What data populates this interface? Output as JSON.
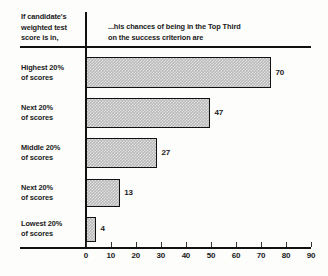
{
  "header": {
    "left_line1": "If candidate's",
    "left_line2": "weighted test",
    "left_line3": "score is in,",
    "right_line1": "...his chances of being in the Top Third",
    "right_line2": "on the success criterion are"
  },
  "colors": {
    "ink": "#111111",
    "bar_fill": "#b9b9b9",
    "background": "#fdfdfc"
  },
  "chart_data": {
    "type": "bar",
    "orientation": "horizontal",
    "title": "If candidate's weighted test score is in, ...his chances of being in the Top Third on the success criterion are",
    "xlabel": "",
    "ylabel": "",
    "xlim": [
      0,
      90
    ],
    "xticks": [
      0,
      10,
      20,
      30,
      40,
      50,
      60,
      70,
      80,
      90
    ],
    "grid": false,
    "legend": false,
    "categories": [
      "Highest 20% of scores",
      "Next 20% of scores",
      "Middle 20% of scores",
      "Next 20% of scores",
      "Lowest 20% of scores"
    ],
    "values": [
      70,
      47,
      27,
      13,
      4
    ],
    "bars": [
      {
        "label_line1": "Highest 20%",
        "label_line2": "of scores",
        "value": 70,
        "value_text": "70"
      },
      {
        "label_line1": "Next 20%",
        "label_line2": "of scores",
        "value": 47,
        "value_text": "47"
      },
      {
        "label_line1": "Middle 20%",
        "label_line2": "of scores",
        "value": 27,
        "value_text": "27"
      },
      {
        "label_line1": "Next 20%",
        "label_line2": "of scores",
        "value": 13,
        "value_text": "13"
      },
      {
        "label_line1": "Lowest 20%",
        "label_line2": "of scores",
        "value": 4,
        "value_text": "4"
      }
    ],
    "tick_labels": [
      "0",
      "10",
      "20",
      "30",
      "40",
      "50",
      "60",
      "70",
      "80",
      "90"
    ]
  }
}
